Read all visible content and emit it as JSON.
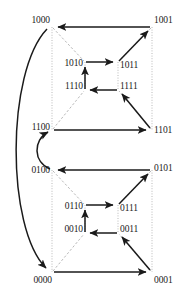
{
  "figure": {
    "width": 192,
    "height": 299,
    "background": "#ffffff",
    "edge_color": "#1a1a1a",
    "guide_color": "#b9b9b9",
    "label_color": "#1a1a1a"
  },
  "nodes": [
    {
      "id": "n1000",
      "label": "1000",
      "x": 52,
      "y": 27,
      "anchor": "above-l",
      "lx": 50,
      "ly": 25
    },
    {
      "id": "n1001",
      "label": "1001",
      "x": 152,
      "y": 27,
      "anchor": "above-r",
      "lx": 154,
      "ly": 25
    },
    {
      "id": "n1010",
      "label": "1010",
      "x": 85,
      "y": 62,
      "anchor": "left",
      "lx": 83,
      "ly": 63
    },
    {
      "id": "n1011",
      "label": "1011",
      "x": 118,
      "y": 62,
      "anchor": "right",
      "lx": 120,
      "ly": 65
    },
    {
      "id": "n1110",
      "label": "1110",
      "x": 85,
      "y": 90,
      "anchor": "left",
      "lx": 83,
      "ly": 85
    },
    {
      "id": "n1111",
      "label": "1111",
      "x": 118,
      "y": 90,
      "anchor": "right",
      "lx": 120,
      "ly": 85
    },
    {
      "id": "n1100",
      "label": "1100",
      "x": 52,
      "y": 130,
      "anchor": "left",
      "lx": 50,
      "ly": 126
    },
    {
      "id": "n1101",
      "label": "1101",
      "x": 152,
      "y": 130,
      "anchor": "right",
      "lx": 154,
      "ly": 130
    },
    {
      "id": "n0100",
      "label": "0100",
      "x": 52,
      "y": 170,
      "anchor": "left",
      "lx": 50,
      "ly": 170
    },
    {
      "id": "n0101",
      "label": "0101",
      "x": 152,
      "y": 170,
      "anchor": "right",
      "lx": 154,
      "ly": 168
    },
    {
      "id": "n0110",
      "label": "0110",
      "x": 85,
      "y": 205,
      "anchor": "left",
      "lx": 83,
      "ly": 206
    },
    {
      "id": "n0111",
      "label": "0111",
      "x": 118,
      "y": 205,
      "anchor": "right",
      "lx": 120,
      "ly": 208
    },
    {
      "id": "n0010",
      "label": "0010",
      "x": 85,
      "y": 233,
      "anchor": "left",
      "lx": 83,
      "ly": 228
    },
    {
      "id": "n0011",
      "label": "0011",
      "x": 118,
      "y": 233,
      "anchor": "right",
      "lx": 120,
      "ly": 228
    },
    {
      "id": "n0000",
      "label": "0000",
      "x": 52,
      "y": 272,
      "anchor": "below-l",
      "lx": 52,
      "ly": 275
    },
    {
      "id": "n0001",
      "label": "0001",
      "x": 152,
      "y": 272,
      "anchor": "below-r",
      "lx": 154,
      "ly": 275
    }
  ],
  "directed_edges": [
    {
      "from": "1001",
      "to": "1000",
      "style": "solid",
      "shape": "line"
    },
    {
      "from": "1100",
      "to": "1101",
      "style": "solid",
      "shape": "line"
    },
    {
      "from": "1010",
      "to": "1011",
      "style": "solid",
      "shape": "line"
    },
    {
      "from": "1111",
      "to": "1110",
      "style": "solid",
      "shape": "line"
    },
    {
      "from": "1110",
      "to": "1010",
      "style": "solid",
      "shape": "line"
    },
    {
      "from": "1011",
      "to": "1001",
      "style": "solid",
      "shape": "line"
    },
    {
      "from": "1101",
      "to": "1111",
      "style": "solid",
      "shape": "line"
    },
    {
      "from": "0101",
      "to": "0100",
      "style": "solid",
      "shape": "line"
    },
    {
      "from": "0000",
      "to": "0001",
      "style": "solid",
      "shape": "line"
    },
    {
      "from": "0110",
      "to": "0111",
      "style": "solid",
      "shape": "line"
    },
    {
      "from": "0011",
      "to": "0010",
      "style": "solid",
      "shape": "line"
    },
    {
      "from": "0010",
      "to": "0110",
      "style": "solid",
      "shape": "line"
    },
    {
      "from": "0111",
      "to": "0101",
      "style": "solid",
      "shape": "line"
    },
    {
      "from": "0001",
      "to": "0011",
      "style": "solid",
      "shape": "line"
    },
    {
      "from": "0100",
      "to": "1100",
      "style": "solid",
      "shape": "curve-left-small"
    },
    {
      "from": "1000",
      "to": "0000",
      "style": "solid",
      "shape": "curve-left-large"
    }
  ],
  "guide_edges": [
    {
      "from": "1000",
      "to": "1100",
      "style": "dotted",
      "orientation": "vertical"
    },
    {
      "from": "1001",
      "to": "1101",
      "style": "dotted",
      "orientation": "vertical"
    },
    {
      "from": "1010",
      "to": "1110",
      "style": "dotted",
      "orientation": "vertical"
    },
    {
      "from": "1011",
      "to": "1111",
      "style": "dotted",
      "orientation": "vertical"
    },
    {
      "from": "1000",
      "to": "1010",
      "style": "dashed",
      "orientation": "diagonal"
    },
    {
      "from": "1001",
      "to": "1011",
      "style": "dashed",
      "orientation": "diagonal"
    },
    {
      "from": "1100",
      "to": "1110",
      "style": "dashed",
      "orientation": "diagonal"
    },
    {
      "from": "1101",
      "to": "1111",
      "style": "dashed",
      "orientation": "diagonal"
    },
    {
      "from": "0100",
      "to": "0000",
      "style": "dotted",
      "orientation": "vertical"
    },
    {
      "from": "0101",
      "to": "0001",
      "style": "dotted",
      "orientation": "vertical"
    },
    {
      "from": "0110",
      "to": "0010",
      "style": "dotted",
      "orientation": "vertical"
    },
    {
      "from": "0111",
      "to": "0011",
      "style": "dotted",
      "orientation": "vertical"
    },
    {
      "from": "0100",
      "to": "0110",
      "style": "dashed",
      "orientation": "diagonal"
    },
    {
      "from": "0101",
      "to": "0111",
      "style": "dashed",
      "orientation": "diagonal"
    },
    {
      "from": "0000",
      "to": "0010",
      "style": "dashed",
      "orientation": "diagonal"
    },
    {
      "from": "0001",
      "to": "0011",
      "style": "dashed",
      "orientation": "diagonal"
    }
  ]
}
